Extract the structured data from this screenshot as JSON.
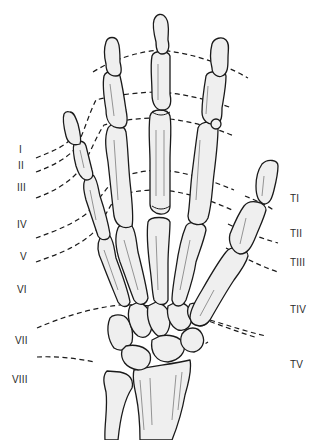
{
  "diagram": {
    "finger_zones": [
      {
        "label": "I",
        "x": 19,
        "y": 145
      },
      {
        "label": "II",
        "x": 18,
        "y": 162
      },
      {
        "label": "III",
        "x": 17,
        "y": 183
      },
      {
        "label": "IV",
        "x": 17,
        "y": 220
      },
      {
        "label": "V",
        "x": 20,
        "y": 252
      },
      {
        "label": "VI",
        "x": 17,
        "y": 285
      },
      {
        "label": "VII",
        "x": 15,
        "y": 337
      },
      {
        "label": "VIII",
        "x": 12,
        "y": 375
      }
    ],
    "thumb_zones": [
      {
        "label": "TI",
        "x": 290,
        "y": 195
      },
      {
        "label": "TII",
        "x": 290,
        "y": 230
      },
      {
        "label": "TIII",
        "x": 290,
        "y": 258
      },
      {
        "label": "TIV",
        "x": 290,
        "y": 305
      },
      {
        "label": "TV",
        "x": 290,
        "y": 360
      }
    ],
    "colors": {
      "bone_fill": "#efefef",
      "outline": "#1a1a1a",
      "label_text": "#2a2a2a",
      "background": "#ffffff"
    }
  }
}
